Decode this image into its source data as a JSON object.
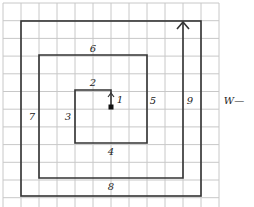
{
  "diagram": {
    "type": "square-spiral-search-pattern",
    "grid": {
      "origin_x": 3,
      "origin_y": 3,
      "cell_w": 18,
      "cell_h": 17.7,
      "cols": 12,
      "rows": 12,
      "color": "#c8c8c8"
    },
    "line_color": "#333333",
    "start_marker": {
      "x": 111,
      "y": 107
    },
    "frame": {
      "x1": 21,
      "y1": 21,
      "x2": 201,
      "y2": 196
    },
    "spiral_points": [
      [
        111,
        107
      ],
      [
        111,
        90
      ],
      [
        75,
        90
      ],
      [
        75,
        143
      ],
      [
        147,
        143
      ],
      [
        147,
        55
      ],
      [
        39,
        55
      ],
      [
        39,
        178
      ],
      [
        183,
        178
      ],
      [
        183,
        22
      ]
    ],
    "segment_labels": [
      {
        "text": "1",
        "x": 120,
        "y": 100
      },
      {
        "text": "2",
        "x": 93,
        "y": 83
      },
      {
        "text": "3",
        "x": 68,
        "y": 117
      },
      {
        "text": "4",
        "x": 111,
        "y": 152
      },
      {
        "text": "5",
        "x": 153,
        "y": 101
      },
      {
        "text": "6",
        "x": 93,
        "y": 49
      },
      {
        "text": "7",
        "x": 32,
        "y": 117
      },
      {
        "text": "8",
        "x": 111,
        "y": 187
      },
      {
        "text": "9",
        "x": 190,
        "y": 101
      }
    ],
    "width_label": {
      "text": "W—",
      "x": 234,
      "y": 101
    }
  }
}
